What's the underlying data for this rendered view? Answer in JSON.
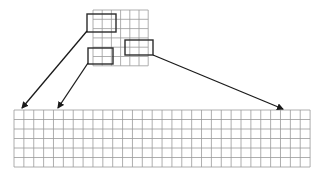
{
  "diagram": {
    "colors": {
      "background": "#ffffff",
      "grid_line": "#9a9a9a",
      "highlight_box": "#2b2b2b",
      "arrow": "#1a1a1a"
    },
    "source_grid": {
      "x": 93,
      "y": 10,
      "cols": 6,
      "rows": 6,
      "cell_w": 9.2,
      "cell_h": 9.3
    },
    "target_grid": {
      "x": 14,
      "y": 110,
      "cols": 30,
      "rows": 6,
      "cell_w": 9.87,
      "cell_h": 9.5
    },
    "highlights": [
      {
        "id": "patch-1",
        "x": 87,
        "y": 14,
        "w": 29,
        "h": 18
      },
      {
        "id": "patch-2",
        "x": 88,
        "y": 48,
        "w": 25,
        "h": 16
      },
      {
        "id": "patch-3",
        "x": 125,
        "y": 40,
        "w": 28,
        "h": 15
      }
    ],
    "arrows": [
      {
        "id": "arrow-1",
        "from": [
          87,
          31
        ],
        "to": [
          22,
          108
        ]
      },
      {
        "id": "arrow-2",
        "from": [
          88,
          63
        ],
        "to": [
          58,
          108
        ]
      },
      {
        "id": "arrow-3",
        "from": [
          153,
          55
        ],
        "to": [
          283,
          109
        ]
      }
    ]
  }
}
